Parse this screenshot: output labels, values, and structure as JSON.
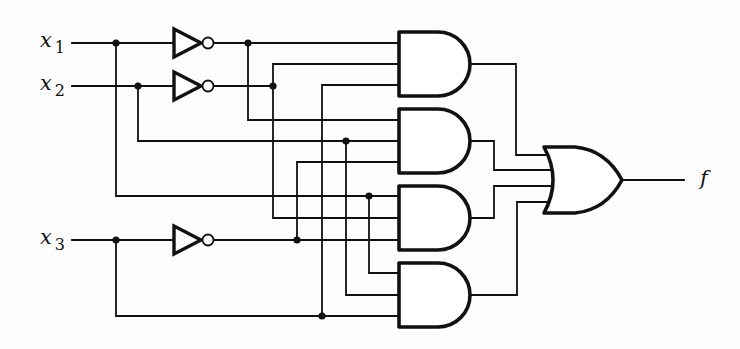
{
  "diagram": {
    "type": "logic-circuit",
    "inputs": [
      {
        "id": "x1",
        "name": "x",
        "sub": "1",
        "y": 43
      },
      {
        "id": "x2",
        "name": "x",
        "sub": "2",
        "y": 86
      },
      {
        "id": "x3",
        "name": "x",
        "sub": "3",
        "y": 240
      }
    ],
    "output": {
      "id": "f",
      "label": "f"
    },
    "gates": {
      "inverters": [
        "NOT x1",
        "NOT x2",
        "NOT x3"
      ],
      "and_gates": [
        {
          "id": "and1",
          "inputs": [
            "x1'",
            "x2'",
            "x3"
          ]
        },
        {
          "id": "and2",
          "inputs": [
            "x1'",
            "x2",
            "x3'"
          ]
        },
        {
          "id": "and3",
          "inputs": [
            "x1",
            "x2'",
            "x3'"
          ]
        },
        {
          "id": "and4",
          "inputs": [
            "x2",
            "x3'",
            "x3"
          ]
        }
      ],
      "or_gate": {
        "id": "or1",
        "inputs": [
          "and1",
          "and2",
          "and3",
          "and4"
        ],
        "output": "f"
      }
    }
  }
}
